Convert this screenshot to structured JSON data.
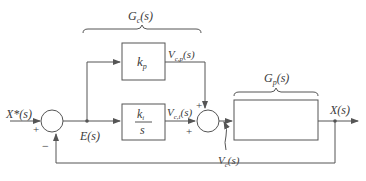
{
  "diagram": {
    "type": "PI control feedback loop block diagram",
    "colors": {
      "line": "#555555",
      "text": "#3a3a3a",
      "background": "#ffffff"
    },
    "labels": {
      "controller_group": "G",
      "controller_group_sub": "c",
      "plant_group": "G",
      "plant_group_sub": "p",
      "input": "X*(s)",
      "error": "E(s)",
      "output": "X(s)",
      "prop_output": "V",
      "prop_output_sub": "c,p",
      "int_output": "V",
      "int_output_sub": "c,i",
      "disturbance": "V",
      "disturbance_sub": "c",
      "arg": "(s)"
    },
    "blocks": {
      "proportional": {
        "gain": "k",
        "gain_sub": "p"
      },
      "integral": {
        "numerator": "k",
        "numerator_sub": "i",
        "denominator": "s"
      },
      "plant": {
        "content": ""
      }
    },
    "summing_junctions": [
      {
        "id": "sum1",
        "signs": {
          "left": "+",
          "bottom": "−"
        }
      },
      {
        "id": "sum2",
        "signs": {
          "top": "+",
          "left": "+"
        }
      }
    ]
  }
}
